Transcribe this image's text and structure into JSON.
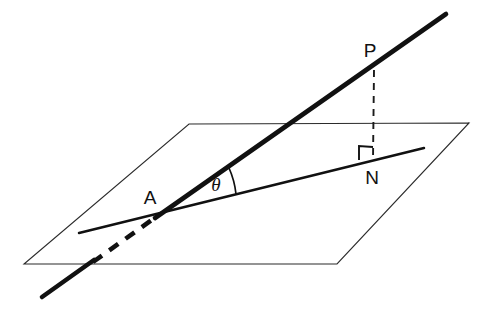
{
  "figure": {
    "background_color": "#ffffff",
    "stroke_color": "#111111",
    "plane_stroke_color": "#2b2b2b",
    "width": 491,
    "height": 313
  },
  "labels": {
    "point_a": "A",
    "point_p": "P",
    "point_n": "N",
    "angle_theta": "θ"
  },
  "elements": {
    "plane_name": "reference-plane",
    "oblique_line_name": "oblique-line-through-A-and-P",
    "projection_line_name": "projection-line-AN",
    "perpendicular_name": "perpendicular-segment-PN",
    "right_angle_name": "right-angle-marker-at-N",
    "angle_arc_name": "angle-arc-theta-at-A"
  },
  "geometry": {
    "plane_vertices": [
      [
        189,
        124
      ],
      [
        469,
        123
      ],
      [
        337,
        264
      ],
      [
        24,
        264
      ]
    ],
    "oblique_line_solid": [
      [
        92,
        264
      ],
      [
        446,
        14
      ]
    ],
    "oblique_line_hidden": [
      [
        92,
        264
      ],
      [
        158,
        215
      ]
    ],
    "oblique_line_lower_tail": [
      [
        42,
        297
      ],
      [
        92,
        264
      ]
    ],
    "projection_line": [
      [
        79,
        233
      ],
      [
        424,
        148
      ]
    ],
    "perpendicular_segment": [
      [
        374,
        70
      ],
      [
        373,
        160
      ]
    ],
    "point_a": [
      158,
      215
    ],
    "point_p": [
      374,
      70
    ],
    "point_n": [
      373,
      160
    ],
    "label_a_pos": [
      150,
      199
    ],
    "label_p_pos": [
      370,
      52
    ],
    "label_n_pos": [
      372,
      179
    ],
    "label_theta_pos": [
      216,
      187
    ],
    "angle_arc": {
      "center": [
        158,
        215
      ],
      "start": [
        229,
        168
      ],
      "end": [
        236,
        194
      ]
    },
    "right_angle_mark": [
      [
        359,
        160
      ],
      [
        359,
        146
      ],
      [
        373,
        147
      ]
    ]
  }
}
